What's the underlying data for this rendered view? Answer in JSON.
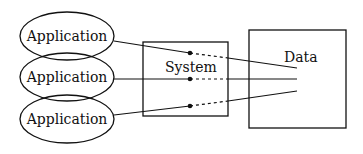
{
  "diagram": {
    "applications": [
      {
        "label": "Application"
      },
      {
        "label": "Application"
      },
      {
        "label": "Application"
      }
    ],
    "system": {
      "label": "System"
    },
    "data": {
      "label": "Data"
    },
    "colors": {
      "stroke": "#111111",
      "background": "#ffffff"
    }
  }
}
